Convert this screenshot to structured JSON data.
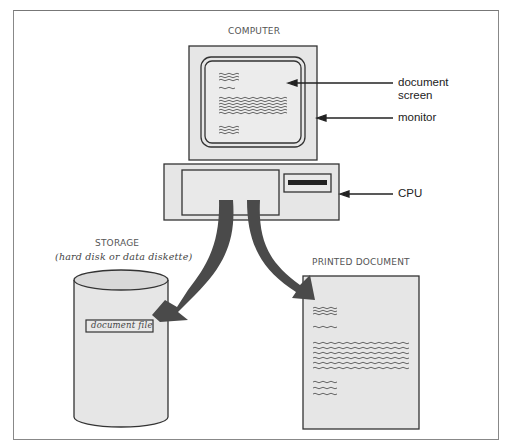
{
  "diagram": {
    "title_computer": "COMPUTER",
    "callouts": {
      "document_screen_line1": "document",
      "document_screen_line2": "screen",
      "monitor": "monitor",
      "cpu": "CPU"
    },
    "storage": {
      "title": "STORAGE",
      "subtitle": "(hard disk or data diskette)",
      "file_label": "document file"
    },
    "printed": {
      "title": "PRINTED DOCUMENT"
    },
    "colors": {
      "fill": "#e6e6e6",
      "stroke": "#333333",
      "arrow": "#4a4a4a",
      "frame": "#888888"
    }
  }
}
